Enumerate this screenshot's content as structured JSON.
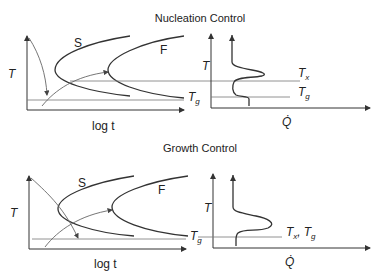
{
  "panels": [
    {
      "title": "Nucleation Control",
      "ttt": {
        "y_axis_label": "T",
        "x_axis_label": "log t",
        "curve_labels": [
          "S",
          "F"
        ],
        "line_label_main": "T",
        "line_label_sub": "g"
      },
      "dsc": {
        "y_axis_label": "T",
        "x_axis_label": "Q̇",
        "labels": [
          {
            "main": "T",
            "sub": "x"
          },
          {
            "main": "T",
            "sub": "g"
          }
        ]
      }
    },
    {
      "title": "Growth Control",
      "ttt": {
        "y_axis_label": "T",
        "x_axis_label": "log t",
        "curve_labels": [
          "S",
          "F"
        ],
        "line_label_main": "T",
        "line_label_sub": "g"
      },
      "dsc": {
        "y_axis_label": "T",
        "x_axis_label": "Q̇",
        "combined_label": {
          "main1": "T",
          "sub1": "x",
          "sep": ",",
          "main2": "T",
          "sub2": "g"
        }
      }
    }
  ]
}
